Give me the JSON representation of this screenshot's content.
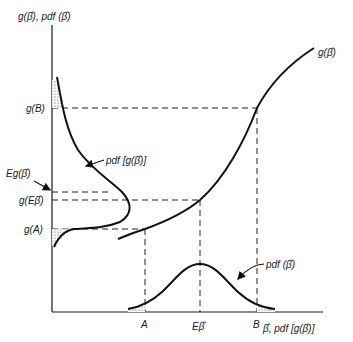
{
  "axes": {
    "y_label": "g(β̂), pdf (β̂)",
    "x_label": "β̂, pdf [g(β̂)]"
  },
  "y_ticks": {
    "gB": "g(B)",
    "EgB": "Eg(β̂)",
    "gEB": "g(Eβ̂)",
    "gA": "g(A)"
  },
  "x_ticks": {
    "A": "A",
    "EB": "Eβ̂",
    "B": "B"
  },
  "curve_labels": {
    "g": "g(β̂)",
    "pdf_g": "pdf [g(β̂)]",
    "pdf_b": "pdf (β̂)"
  },
  "colors": {
    "ink": "#111111",
    "background": "#ffffff"
  }
}
